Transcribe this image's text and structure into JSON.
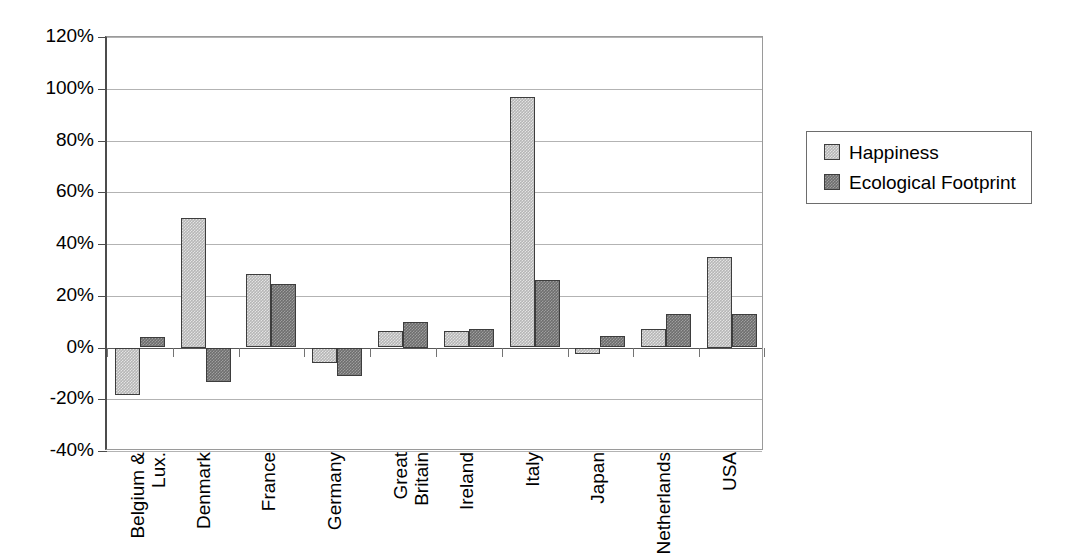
{
  "chart_data": {
    "type": "bar",
    "title": "",
    "subtitle": "",
    "xlabel": "",
    "ylabel": "",
    "categories": [
      "Belgium & Lux.",
      "Denmark",
      "France",
      "Germany",
      "Great Britain",
      "Ireland",
      "Italy",
      "Japan",
      "Netherlands",
      "USA"
    ],
    "category_lines": [
      [
        "Belgium &",
        "Lux."
      ],
      [
        "Denmark"
      ],
      [
        "France"
      ],
      [
        "Germany"
      ],
      [
        "Great",
        "Britain"
      ],
      [
        "Ireland"
      ],
      [
        "Italy"
      ],
      [
        "Japan"
      ],
      [
        "Netherlands"
      ],
      [
        "USA"
      ]
    ],
    "series": [
      {
        "name": "Happiness",
        "color": "#b6b6b6",
        "values": [
          -18.5,
          50,
          28.5,
          -6,
          6.5,
          6.5,
          97,
          -2.5,
          7,
          35
        ]
      },
      {
        "name": "Ecological Footprint",
        "color": "#6e6e6e",
        "values": [
          4,
          -13.5,
          24.5,
          -11,
          10,
          7,
          26,
          4.5,
          13,
          13
        ]
      }
    ],
    "ylim": [
      -40,
      120
    ],
    "ytick_values": [
      120,
      100,
      80,
      60,
      40,
      20,
      0,
      -20,
      -40
    ],
    "ytick_labels": [
      "120%",
      "100%",
      "80%",
      "60%",
      "40%",
      "20%",
      "0%",
      "-20%",
      "-40%"
    ],
    "grid": true,
    "value_format": "percent",
    "legend_position": "right",
    "legend_entries": [
      "Happiness",
      "Ecological Footprint"
    ],
    "plot_background": "#ffffff",
    "gridline_color": "#b3b3b3",
    "axis_color": "#4c4c4c",
    "zero_line_color": "#575757"
  }
}
